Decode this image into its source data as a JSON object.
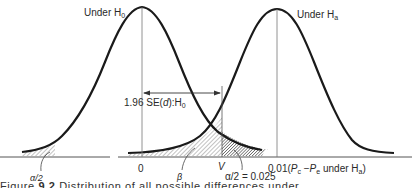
{
  "diagram": {
    "type": "hypothesis-test-distributions",
    "null_curve_label": "Under H",
    "null_curve_sub": "0",
    "alt_curve_label": "Under H",
    "alt_curve_sub": "a",
    "interval_label": "1.96 SE(",
    "interval_label_var": "d",
    "interval_label_end": "):H",
    "interval_label_sub": "0",
    "left_tail_label": "α/2",
    "beta_label": "β",
    "right_tail_label": "α/2 = 0.025",
    "axis_zero": "0",
    "axis_v": "V",
    "axis_alt_prefix": "0.01(",
    "axis_alt_pc": "P",
    "axis_alt_pc_sub": "c",
    "axis_alt_minus": " −",
    "axis_alt_pe": "P",
    "axis_alt_pe_sub": "e",
    "axis_alt_suffix": " under H",
    "axis_alt_suffix_sub": "a",
    "axis_alt_close": ")"
  },
  "caption": {
    "prefix": "Figure",
    "number": "9.2",
    "text": "Distribution of all possible differences under"
  },
  "colors": {
    "curve": "#1a1a1a",
    "axis": "#444444",
    "hatch": "#555555"
  }
}
